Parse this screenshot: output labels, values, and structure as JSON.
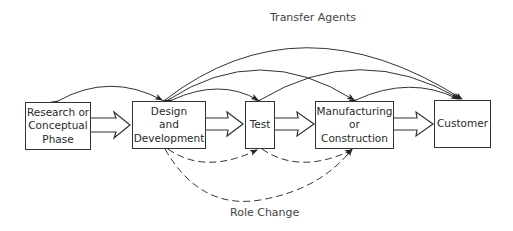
{
  "diagram": {
    "title_top": "Transfer Agents",
    "title_bottom": "Role Change",
    "nodes": [
      {
        "id": "research",
        "label": "Research or\nConceptual\nPhase"
      },
      {
        "id": "design",
        "label": "Design\nand\nDevelopment"
      },
      {
        "id": "test",
        "label": "Test"
      },
      {
        "id": "manufacturing",
        "label": "Manufacturing\nor\nConstruction"
      },
      {
        "id": "customer",
        "label": "Customer"
      }
    ],
    "flow_arrows": [
      {
        "from": "research",
        "to": "design",
        "style": "hollow-block"
      },
      {
        "from": "design",
        "to": "test",
        "style": "hollow-block"
      },
      {
        "from": "test",
        "to": "manufacturing",
        "style": "hollow-block"
      },
      {
        "from": "manufacturing",
        "to": "customer",
        "style": "hollow-block"
      }
    ],
    "transfer_agent_arcs": [
      {
        "from": "research",
        "to": "design",
        "bidirectional": true
      },
      {
        "from": "design",
        "to": "test",
        "bidirectional": true
      },
      {
        "from": "design",
        "to": "manufacturing",
        "bidirectional": true
      },
      {
        "from": "design",
        "to": "customer",
        "bidirectional": true
      },
      {
        "from": "test",
        "to": "customer",
        "bidirectional": true
      },
      {
        "from": "manufacturing",
        "to": "customer",
        "bidirectional": true
      }
    ],
    "role_change_arcs": [
      {
        "from": "design",
        "to": "test",
        "style": "dashed"
      },
      {
        "from": "design",
        "to": "manufacturing",
        "style": "dashed"
      },
      {
        "from": "test",
        "to": "manufacturing",
        "style": "dashed"
      }
    ]
  }
}
